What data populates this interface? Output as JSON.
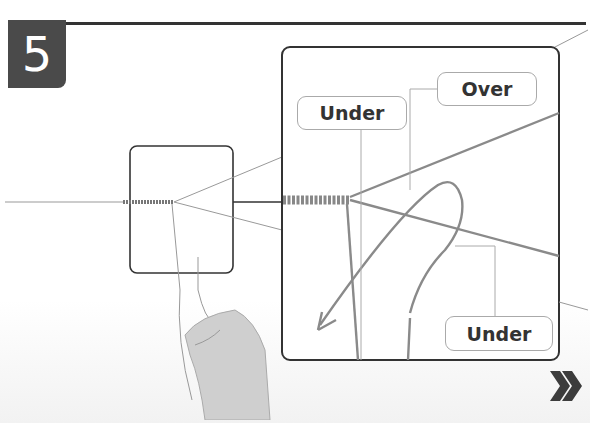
{
  "step": {
    "number": "5"
  },
  "labels": {
    "under_top": "Under",
    "over": "Over",
    "under_bottom": "Under"
  },
  "navigation": {
    "next_icon": "double-chevron-right-icon"
  },
  "colors": {
    "badge": "#4a4a4a",
    "frame": "#333333",
    "strand": "#8a8a8a",
    "label_border": "#aaaaaa"
  }
}
